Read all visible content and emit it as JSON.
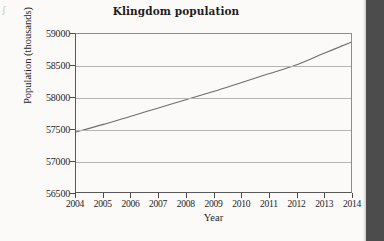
{
  "figure": {
    "margin_mark": "ʃ"
  },
  "chart_data": {
    "type": "line",
    "title": "Klingdom population",
    "xlabel": "Year",
    "ylabel": "Population (thousands)",
    "grid": "horizontal",
    "legend": "none",
    "xlim": [
      2004,
      2014
    ],
    "ylim": [
      56500,
      59000
    ],
    "xticks": [
      2004,
      2005,
      2006,
      2007,
      2008,
      2009,
      2010,
      2011,
      2012,
      2013,
      2014
    ],
    "xtick_labels": [
      "2004",
      "2005",
      "2006",
      "2007",
      "2008",
      "2009",
      "2010",
      "2011",
      "2012",
      "2013",
      "2014"
    ],
    "yticks": [
      56500,
      57000,
      57500,
      58000,
      58500,
      59000
    ],
    "ytick_labels": [
      "56500",
      "57000",
      "57500",
      "58000",
      "58500",
      "59000"
    ],
    "series": [
      {
        "name": "Klingdom population",
        "color": "#6e6e6e",
        "x": [
          2004,
          2005,
          2006,
          2007,
          2008,
          2009,
          2010,
          2011,
          2012,
          2013,
          2014
        ],
        "values": [
          57450,
          57570,
          57700,
          57830,
          57960,
          58090,
          58230,
          58370,
          58510,
          58690,
          58870
        ]
      }
    ]
  },
  "colors": {
    "line": "#6e6e6e",
    "grid": "#b4b4b4",
    "axis": "#595959",
    "text": "#262626",
    "title": "#1d1d1d",
    "background": "#fbfaf8",
    "gutter": "#4c4c4c"
  }
}
